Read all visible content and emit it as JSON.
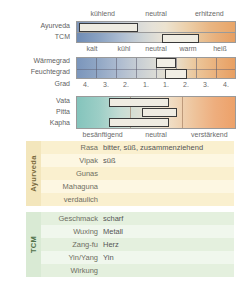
{
  "scale_section": {
    "top_ticks": [
      "kühlend",
      "neutral",
      "erhitzend"
    ],
    "row_labels": [
      "Ayurveda",
      "TCM"
    ],
    "bottom_ticks": [
      "kalt",
      "kühl",
      "neutral",
      "warm",
      "heiß"
    ],
    "ayurveda_marker": {
      "left_pct": 1.5,
      "width_pct": 37
    },
    "tcm_marker": {
      "left_pct": 54,
      "width_pct": 23
    }
  },
  "degree_section": {
    "row_labels": [
      "Wärmegrad",
      "Feuchtegrad",
      "Grad"
    ],
    "ticks": [
      "4.",
      "3.",
      "2.",
      "1.",
      "1.",
      "2.",
      "3.",
      "4."
    ],
    "warmegrad_marker": {
      "left_pct": 50,
      "width_pct": 12.5
    },
    "feuchtegrad_marker": {
      "left_pct": 56,
      "width_pct": 13.5
    }
  },
  "dosha_section": {
    "row_labels": [
      "Vata",
      "Pitta",
      "Kapha"
    ],
    "bottom_ticks": [
      "besänftigend",
      "neutral",
      "verstärkend"
    ],
    "markers": [
      {
        "name": "Vata",
        "left_pct": 20,
        "width_pct": 38
      },
      {
        "name": "Pitta",
        "left_pct": 41,
        "width_pct": 22
      },
      {
        "name": "Kapha",
        "left_pct": 20,
        "width_pct": 38
      }
    ]
  },
  "ayurveda_panel": {
    "spine_label": "Ayurveda",
    "rows": [
      {
        "key": "Rasa",
        "value": "bitter, süß, zusammenziehend"
      },
      {
        "key": "Vipak",
        "value": "süß"
      },
      {
        "key": "Gunas",
        "value": ""
      },
      {
        "key": "Mahaguna",
        "value": ""
      },
      {
        "key": "verdaulich",
        "value": ""
      }
    ]
  },
  "tcm_panel": {
    "spine_label": "TCM",
    "rows": [
      {
        "key": "Geschmack",
        "value": "scharf"
      },
      {
        "key": "Wuxing",
        "value": "Metall"
      },
      {
        "key": "Zang-fu",
        "value": "Herz"
      },
      {
        "key": "Yin/Yang",
        "value": "Yin"
      },
      {
        "key": "Wirkung",
        "value": ""
      }
    ]
  },
  "colors": {
    "cool": "#7d95b8",
    "warm": "#e9a568",
    "dosha_cool": "#84c4bc",
    "ayurveda_panel": "#fdf7e2",
    "tcm_panel": "#f0f7ed",
    "marker_border": "#3a3a3a"
  }
}
